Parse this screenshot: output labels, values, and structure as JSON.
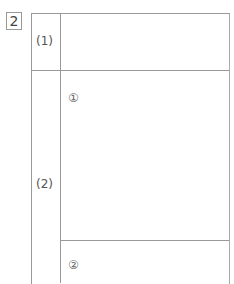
{
  "question_number": "2",
  "rows": [
    {
      "label": "(1)",
      "subitems": []
    },
    {
      "label": "(2)",
      "subitems": [
        "①",
        "②"
      ]
    }
  ]
}
